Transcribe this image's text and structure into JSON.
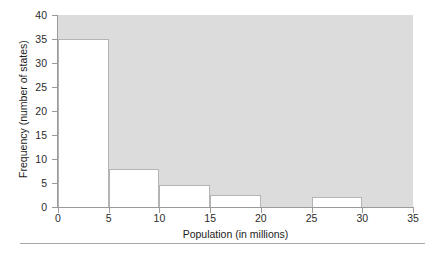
{
  "chart_data": {
    "type": "bar",
    "title": "",
    "subtitle": "",
    "xlabel": "Population (in millions)",
    "ylabel": "Frequency (number of states)",
    "xlim": [
      0,
      35
    ],
    "ylim": [
      0,
      40
    ],
    "xticks": [
      "0",
      "5",
      "10",
      "15",
      "20",
      "25",
      "30",
      "35"
    ],
    "xtick_values": [
      0,
      5,
      10,
      15,
      20,
      25,
      30,
      35
    ],
    "yticks": [
      "0",
      "5",
      "10",
      "15",
      "20",
      "25",
      "30",
      "35",
      "40"
    ],
    "ytick_values": [
      0,
      5,
      10,
      15,
      20,
      25,
      30,
      35,
      40
    ],
    "bin_width": 5,
    "grid": false,
    "legend": null,
    "categories": [
      "0-5",
      "5-10",
      "10-15",
      "15-20",
      "20-25",
      "25-30",
      "30-35"
    ],
    "bin_edges": [
      0,
      5,
      10,
      15,
      20,
      25,
      30,
      35
    ],
    "values": [
      35,
      8,
      4.5,
      2.5,
      0,
      2,
      0
    ],
    "bars": [
      {
        "label": "0-5",
        "start": 0,
        "end": 5,
        "value": 35
      },
      {
        "label": "5-10",
        "start": 5,
        "end": 10,
        "value": 8
      },
      {
        "label": "10-15",
        "start": 10,
        "end": 15,
        "value": 4.5
      },
      {
        "label": "15-20",
        "start": 15,
        "end": 20,
        "value": 2.5
      },
      {
        "label": "20-25",
        "start": 20,
        "end": 25,
        "value": 0
      },
      {
        "label": "25-30",
        "start": 25,
        "end": 30,
        "value": 2
      },
      {
        "label": "30-35",
        "start": 30,
        "end": 35,
        "value": 0
      }
    ],
    "colors": {
      "plot_background": "#dcdcdc",
      "bar_fill": "#ffffff",
      "bar_border": "#b4b4b4",
      "axis": "#9a9a9a",
      "text": "#1c1c1c",
      "page_background": "#ffffff",
      "rule": "#a8a8a8"
    }
  }
}
